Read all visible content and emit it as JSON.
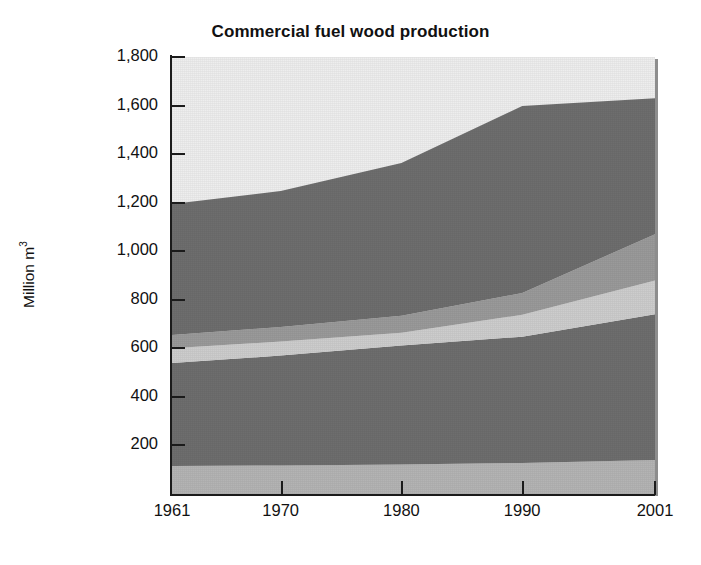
{
  "chart_data": {
    "type": "area",
    "title": "Commercial fuel wood production",
    "xlabel": "",
    "ylabel": "Million m 3",
    "ylabel_main": "Million m",
    "ylabel_sup": "3",
    "x": [
      1961,
      1970,
      1980,
      1990,
      2001
    ],
    "xlim": [
      1961,
      2001
    ],
    "ylim": [
      0,
      1800
    ],
    "ytick_labels": [
      "1,800",
      "1,600",
      "1,400",
      "1,200",
      "1,000",
      "800",
      "600",
      "400",
      "200"
    ],
    "ytick_values": [
      1800,
      1600,
      1400,
      1200,
      1000,
      800,
      600,
      400,
      200
    ],
    "xtick_labels": [
      "1961",
      "1970",
      "1980",
      "1990",
      "2001"
    ],
    "xtick_values": [
      1961,
      1970,
      1980,
      1990,
      2001
    ],
    "grid": false,
    "legend": "none",
    "stacked": true,
    "series": [
      {
        "name": "band-1",
        "color": "#b4b4b4",
        "values": [
          115,
          118,
          122,
          128,
          140
        ]
      },
      {
        "name": "band-2",
        "color": "#6e6e6e",
        "values": [
          425,
          452,
          490,
          520,
          600
        ]
      },
      {
        "name": "band-3",
        "color": "#cdcdcd",
        "values": [
          60,
          58,
          52,
          90,
          140
        ]
      },
      {
        "name": "band-4",
        "color": "#9a9a9a",
        "values": [
          55,
          60,
          70,
          90,
          190
        ]
      },
      {
        "name": "band-5",
        "color": "#6e6e6e",
        "values": [
          540,
          560,
          630,
          770,
          560
        ]
      }
    ],
    "stack_tops": {
      "band-1": [
        115,
        118,
        122,
        128,
        140
      ],
      "band-2": [
        540,
        570,
        612,
        648,
        740
      ],
      "band-3": [
        600,
        628,
        664,
        738,
        880
      ],
      "band-4": [
        655,
        688,
        734,
        828,
        1070
      ],
      "band-5": [
        1195,
        1248,
        1364,
        1598,
        1630
      ]
    },
    "background_color": "#eeeeee",
    "axis_color": "#1b1b1b"
  },
  "axes": {
    "yticks": [
      {
        "label": "1,800",
        "value": 1800
      },
      {
        "label": "1,600",
        "value": 1600
      },
      {
        "label": "1,400",
        "value": 1400
      },
      {
        "label": "1,200",
        "value": 1200
      },
      {
        "label": "1,000",
        "value": 1000
      },
      {
        "label": "800",
        "value": 800
      },
      {
        "label": "600",
        "value": 600
      },
      {
        "label": "400",
        "value": 400
      },
      {
        "label": "200",
        "value": 200
      }
    ],
    "xticks": [
      {
        "label": "1961",
        "value": 1961
      },
      {
        "label": "1970",
        "value": 1970
      },
      {
        "label": "1980",
        "value": 1980
      },
      {
        "label": "1990",
        "value": 1990
      },
      {
        "label": "2001",
        "value": 2001
      }
    ]
  }
}
